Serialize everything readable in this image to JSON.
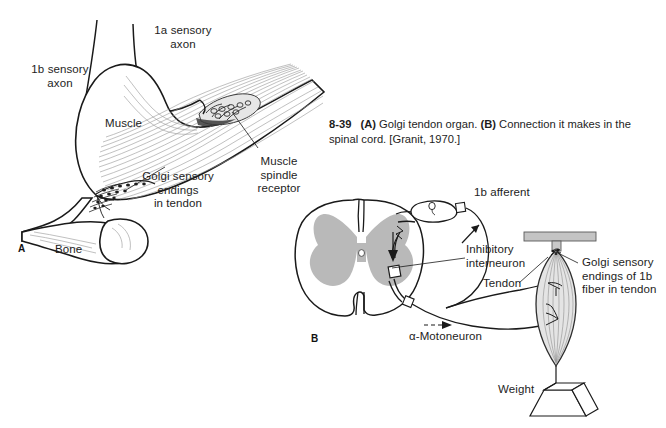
{
  "figure": {
    "number": "8-39",
    "caption_parts": {
      "a_marker": "(A)",
      "a_text": " Golgi tendon organ. ",
      "b_marker": "(B)",
      "b_text": " Connection it makes in the spinal cord. [Granit, 1970.]"
    },
    "caption_full": "8-39 (A) Golgi tendon organ. (B) Connection it makes in the spinal cord. [Granit, 1970.]"
  },
  "panel_a": {
    "letter": "A",
    "labels": {
      "ib_sensory_axon": "1b sensory\naxon",
      "ia_sensory_axon": "1a sensory\naxon",
      "muscle": "Muscle",
      "muscle_spindle_receptor": "Muscle\nspindle\nreceptor",
      "golgi_sensory_endings_in_tendon": "Golgi sensory\nendings\nin tendon",
      "bone": "Bone"
    }
  },
  "panel_b": {
    "letter": "B",
    "labels": {
      "ib_afferent": "1b afferent",
      "inhibitory_interneuron": "Inhibitory\ninterneuron",
      "alpha_motoneuron": "α-Motoneuron",
      "tendon": "Tendon",
      "golgi_sensory_endings_of_1b_fiber": "Golgi sensory\nendings of 1b\nfiber in tendon",
      "weight": "Weight"
    }
  },
  "colors": {
    "background": "#ffffff",
    "ink": "#1a1a1a",
    "gray_matter": "#b9b9b9",
    "light_shade": "#d2d2d2",
    "hatch": "#8c8c8c"
  }
}
